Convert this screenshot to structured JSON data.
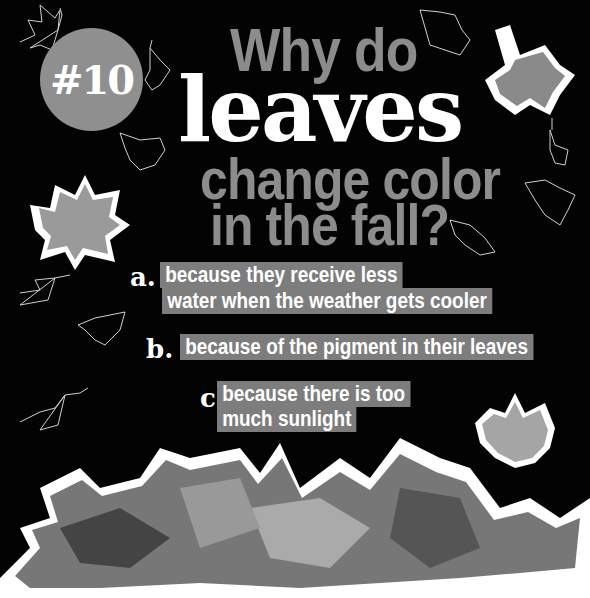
{
  "badge": {
    "label": "#10"
  },
  "title": {
    "line1": "Why do",
    "line2": "leaves",
    "line3": "change color",
    "line4": "in the fall?"
  },
  "answers": [
    {
      "letter": "a.",
      "lines": [
        "because they receive less",
        "water when the weather gets cooler"
      ]
    },
    {
      "letter": "b.",
      "lines": [
        "because of the pigment in their leaves"
      ]
    },
    {
      "letter": "c.",
      "lines": [
        "because there is too",
        "much sunlight"
      ]
    }
  ],
  "page_number": "27",
  "colors": {
    "background": "#030303",
    "badge": "#8f8f8f",
    "title_gray": "#8c8c8c",
    "answer_box": "#7d7d7d",
    "text_white": "#ffffff"
  },
  "decorations": [
    "leaf-outline-icon",
    "maple-leaf-photo",
    "leaf-pile-photo"
  ]
}
